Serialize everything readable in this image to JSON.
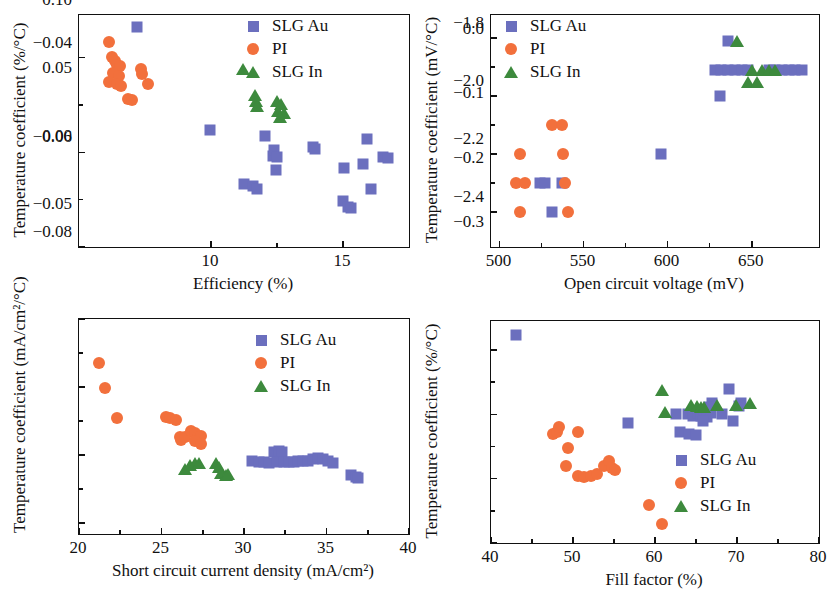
{
  "figure": {
    "panel_count": 4,
    "colors": {
      "slg_au": "#6b6fbe",
      "pi": "#f2703c",
      "slg_in": "#3d8a3d",
      "axis": "#111111"
    },
    "legend_labels": {
      "slg_au": "SLG Au",
      "pi": "PI",
      "slg_in": "SLG In"
    }
  },
  "chart_data": [
    {
      "id": "panel-efficiency",
      "type": "scatter",
      "title": "",
      "xlabel": "Efficiency (%)",
      "ylabel": "Temperature coefficient (%/°C)",
      "xlim": [
        5.0,
        17.5
      ],
      "ylim": [
        -0.08,
        -0.031
      ],
      "xticks": [
        10,
        15
      ],
      "xticklabels": [
        "10",
        "15"
      ],
      "yticks": [
        -0.04,
        -0.06,
        -0.08
      ],
      "yticklabels": [
        "−0.04",
        "−0.06",
        "−0.08"
      ],
      "grid": false,
      "legend_position": "top-right",
      "series": [
        {
          "name": "SLG Au",
          "marker": "square",
          "color": "#6b6fbe",
          "points": [
            [
              7.2,
              -0.0335
            ],
            [
              9.95,
              -0.0552
            ],
            [
              12.05,
              -0.0565
            ],
            [
              12.35,
              -0.0608
            ],
            [
              12.4,
              -0.0595
            ],
            [
              12.5,
              -0.061
            ],
            [
              12.45,
              -0.0638
            ],
            [
              11.25,
              -0.0667
            ],
            [
              11.6,
              -0.0672
            ],
            [
              11.75,
              -0.0678
            ],
            [
              13.85,
              -0.0588
            ],
            [
              13.95,
              -0.0593
            ],
            [
              15.05,
              -0.0633
            ],
            [
              15.9,
              -0.0572
            ],
            [
              15.75,
              -0.0624
            ],
            [
              16.5,
              -0.0609
            ],
            [
              16.7,
              -0.0612
            ],
            [
              16.05,
              -0.0677
            ],
            [
              15.0,
              -0.0702
            ],
            [
              15.2,
              -0.0715
            ],
            [
              15.3,
              -0.0718
            ]
          ]
        },
        {
          "name": "PI",
          "marker": "circle",
          "color": "#f2703c",
          "points": [
            [
              6.15,
              -0.0367
            ],
            [
              6.25,
              -0.0398
            ],
            [
              6.35,
              -0.0408
            ],
            [
              6.45,
              -0.0415
            ],
            [
              6.55,
              -0.0418
            ],
            [
              6.3,
              -0.0432
            ],
            [
              6.5,
              -0.0438
            ],
            [
              6.15,
              -0.0452
            ],
            [
              6.45,
              -0.0455
            ],
            [
              6.6,
              -0.046
            ],
            [
              7.35,
              -0.0423
            ],
            [
              7.4,
              -0.0435
            ],
            [
              7.6,
              -0.0455
            ],
            [
              6.85,
              -0.0488
            ],
            [
              7.0,
              -0.049
            ]
          ]
        },
        {
          "name": "SLG In",
          "marker": "triangle",
          "color": "#3d8a3d",
          "points": [
            [
              11.2,
              -0.0425
            ],
            [
              11.65,
              -0.0478
            ],
            [
              11.7,
              -0.0492
            ],
            [
              11.75,
              -0.0503
            ],
            [
              12.5,
              -0.0492
            ],
            [
              12.65,
              -0.0497
            ],
            [
              12.55,
              -0.0512
            ],
            [
              12.75,
              -0.0516
            ],
            [
              12.6,
              -0.0525
            ]
          ]
        }
      ]
    },
    {
      "id": "panel-voc",
      "type": "scatter",
      "title": "",
      "xlabel": "Open circuit voltage (mV)",
      "ylabel": "Temperature coefficient (mV/°C)",
      "xlim": [
        495,
        690
      ],
      "ylim": [
        -2.52,
        -1.72
      ],
      "xticks": [
        500,
        550,
        600,
        650
      ],
      "xticklabels": [
        "500",
        "550",
        "600",
        "650"
      ],
      "yticks": [
        -1.8,
        -2.0,
        -2.2,
        -2.4
      ],
      "yticklabels": [
        "−1.8",
        "−2.0",
        "−2.2",
        "−2.4"
      ],
      "grid": false,
      "legend_position": "top-left",
      "series": [
        {
          "name": "SLG Au",
          "marker": "square",
          "color": "#6b6fbe",
          "points": [
            [
              636,
              -1.81
            ],
            [
              628,
              -1.91
            ],
            [
              632,
              -1.91
            ],
            [
              636,
              -1.91
            ],
            [
              640,
              -1.91
            ],
            [
              644,
              -1.91
            ],
            [
              648,
              -1.91
            ],
            [
              660,
              -1.91
            ],
            [
              664,
              -1.91
            ],
            [
              668,
              -1.91
            ],
            [
              672,
              -1.91
            ],
            [
              676,
              -1.91
            ],
            [
              680,
              -1.91
            ],
            [
              631,
              -2.0
            ],
            [
              596,
              -2.2
            ],
            [
              524,
              -2.3
            ],
            [
              527,
              -2.3
            ],
            [
              537,
              -2.3
            ],
            [
              531,
              -2.4
            ]
          ]
        },
        {
          "name": "PI",
          "marker": "circle",
          "color": "#f2703c",
          "points": [
            [
              531,
              -2.1
            ],
            [
              537,
              -2.1
            ],
            [
              512,
              -2.2
            ],
            [
              538,
              -2.2
            ],
            [
              510,
              -2.3
            ],
            [
              515,
              -2.3
            ],
            [
              539,
              -2.3
            ],
            [
              512,
              -2.4
            ],
            [
              541,
              -2.4
            ]
          ]
        },
        {
          "name": "SLG In",
          "marker": "triangle",
          "color": "#3d8a3d",
          "points": [
            [
              641,
              -1.81
            ],
            [
              650,
              -1.91
            ],
            [
              656,
              -1.91
            ],
            [
              660,
              -1.91
            ],
            [
              664,
              -1.91
            ],
            [
              648,
              -1.95
            ],
            [
              653,
              -1.95
            ]
          ]
        }
      ]
    },
    {
      "id": "panel-jsc",
      "type": "scatter",
      "title": "",
      "xlabel": "Short circuit current density (mA/cm²)",
      "ylabel": "Temperature coefficient (mA/cm²/°C)",
      "xlim": [
        20,
        40
      ],
      "ylim": [
        -0.058,
        0.1
      ],
      "xticks": [
        20,
        25,
        30,
        35,
        40
      ],
      "xticklabels": [
        "20",
        "25",
        "30",
        "35",
        "40"
      ],
      "yticks": [
        0.1,
        0.05,
        0.0,
        -0.05
      ],
      "yticklabels": [
        "0.10",
        "0.05",
        "0.00",
        "−0.05"
      ],
      "grid": false,
      "legend_position": "top-right",
      "series": [
        {
          "name": "SLG Au",
          "marker": "square",
          "color": "#6b6fbe",
          "points": [
            [
              30.5,
              -0.004
            ],
            [
              30.9,
              -0.005
            ],
            [
              31.2,
              -0.005
            ],
            [
              31.5,
              -0.006
            ],
            [
              31.8,
              0.002
            ],
            [
              32.1,
              0.003
            ],
            [
              32.3,
              0.002
            ],
            [
              32.0,
              -0.005
            ],
            [
              32.4,
              -0.005
            ],
            [
              32.7,
              -0.005
            ],
            [
              33.0,
              -0.005
            ],
            [
              33.3,
              -0.004
            ],
            [
              33.6,
              -0.004
            ],
            [
              33.9,
              -0.004
            ],
            [
              34.2,
              -0.003
            ],
            [
              34.5,
              -0.002
            ],
            [
              34.8,
              -0.003
            ],
            [
              35.1,
              -0.004
            ],
            [
              35.4,
              -0.006
            ],
            [
              36.5,
              -0.015
            ],
            [
              36.8,
              -0.016
            ],
            [
              36.9,
              -0.017
            ]
          ]
        },
        {
          "name": "PI",
          "marker": "circle",
          "color": "#f2703c",
          "points": [
            [
              21.2,
              0.068
            ],
            [
              21.6,
              0.049
            ],
            [
              22.3,
              0.027
            ],
            [
              25.3,
              0.028
            ],
            [
              25.5,
              0.027
            ],
            [
              25.9,
              0.026
            ],
            [
              26.1,
              0.013
            ],
            [
              26.2,
              0.011
            ],
            [
              26.4,
              0.013
            ],
            [
              26.8,
              0.018
            ],
            [
              27.0,
              0.016
            ],
            [
              27.2,
              0.013
            ],
            [
              27.4,
              0.014
            ],
            [
              27.0,
              0.01
            ],
            [
              27.4,
              0.008
            ]
          ]
        },
        {
          "name": "SLG In",
          "marker": "triangle",
          "color": "#3d8a3d",
          "points": [
            [
              26.4,
              -0.01
            ],
            [
              26.7,
              -0.007
            ],
            [
              27.0,
              -0.006
            ],
            [
              27.3,
              -0.006
            ],
            [
              28.3,
              -0.006
            ],
            [
              28.5,
              -0.009
            ],
            [
              28.6,
              -0.013
            ],
            [
              28.9,
              -0.015
            ],
            [
              29.0,
              -0.014
            ]
          ]
        }
      ]
    },
    {
      "id": "panel-ff",
      "type": "scatter",
      "title": "",
      "xlabel": "Fill factor (%)",
      "ylabel": "Temperature coefficient (%/°C)",
      "xlim": [
        40,
        80
      ],
      "ylim": [
        -0.3,
        0.045
      ],
      "xticks": [
        40,
        50,
        60,
        70,
        80
      ],
      "xticklabels": [
        "40",
        "50",
        "60",
        "70",
        "80"
      ],
      "yticks": [
        0.0,
        -0.1,
        -0.2,
        -0.3
      ],
      "yticklabels": [
        "0.0",
        "−0.1",
        "−0.2",
        "−0.3"
      ],
      "grid": false,
      "legend_position": "bottom-right",
      "series": [
        {
          "name": "SLG Au",
          "marker": "square",
          "color": "#6b6fbe",
          "points": [
            [
              43.1,
              0.023
            ],
            [
              56.7,
              -0.114
            ],
            [
              62.6,
              -0.099
            ],
            [
              64.0,
              -0.1
            ],
            [
              64.6,
              -0.103
            ],
            [
              65.2,
              -0.098
            ],
            [
              65.6,
              -0.102
            ],
            [
              66.0,
              -0.1
            ],
            [
              66.4,
              -0.104
            ],
            [
              66.8,
              -0.098
            ],
            [
              67.0,
              -0.083
            ],
            [
              66.6,
              -0.088
            ],
            [
              68.2,
              -0.099
            ],
            [
              69.0,
              -0.061
            ],
            [
              69.5,
              -0.111
            ],
            [
              70.2,
              -0.087
            ],
            [
              70.5,
              -0.082
            ],
            [
              63.0,
              -0.128
            ],
            [
              64.2,
              -0.131
            ],
            [
              65.0,
              -0.132
            ],
            [
              65.8,
              -0.11
            ]
          ]
        },
        {
          "name": "PI",
          "marker": "circle",
          "color": "#f2703c",
          "points": [
            [
              47.6,
              -0.131
            ],
            [
              48.0,
              -0.127
            ],
            [
              48.3,
              -0.12
            ],
            [
              49.4,
              -0.152
            ],
            [
              50.6,
              -0.128
            ],
            [
              49.1,
              -0.18
            ],
            [
              50.6,
              -0.196
            ],
            [
              51.4,
              -0.197
            ],
            [
              52.2,
              -0.196
            ],
            [
              52.9,
              -0.192
            ],
            [
              53.8,
              -0.181
            ],
            [
              54.4,
              -0.172
            ],
            [
              54.8,
              -0.184
            ],
            [
              55.1,
              -0.186
            ],
            [
              59.3,
              -0.241
            ],
            [
              60.8,
              -0.271
            ]
          ]
        },
        {
          "name": "SLG In",
          "marker": "triangle",
          "color": "#3d8a3d",
          "points": [
            [
              60.9,
              -0.063
            ],
            [
              61.2,
              -0.097
            ],
            [
              64.4,
              -0.085
            ],
            [
              65.1,
              -0.087
            ],
            [
              65.6,
              -0.089
            ],
            [
              66.0,
              -0.088
            ],
            [
              67.6,
              -0.085
            ],
            [
              69.9,
              -0.085
            ],
            [
              71.6,
              -0.082
            ]
          ]
        }
      ]
    }
  ]
}
